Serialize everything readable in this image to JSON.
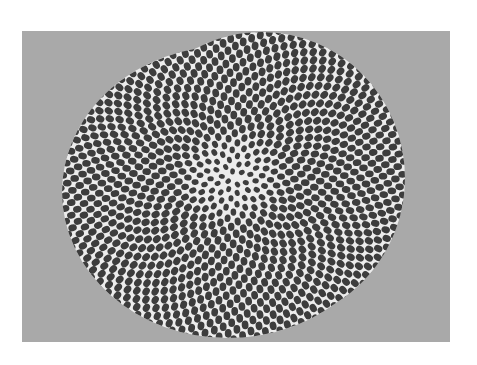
{
  "image": {
    "description": "Photograph of an artwork: hundreds of dark oval seeds arranged in interlocking spiral (phyllotaxis) patterns forming a large round disc on a gray background",
    "canvas": {
      "width": 477,
      "height": 365,
      "background": "#ffffff"
    },
    "panel": {
      "x": 22,
      "y": 31,
      "width": 428,
      "height": 311,
      "color": "#a9a9a9"
    },
    "disc": {
      "gap_color": "#ececec",
      "lobes": [
        {
          "cx": 228,
          "cy": 192,
          "rx": 166,
          "ry": 146
        },
        {
          "cx": 262,
          "cy": 178,
          "rx": 143,
          "ry": 146
        }
      ]
    },
    "seeds": {
      "color": "#3d3d3d",
      "center": {
        "x": 232,
        "y": 178
      },
      "count": 1250,
      "spacing": 5.05,
      "size": {
        "rx": 4.3,
        "ry": 3.4
      },
      "golden_angle_deg": 137.508
    }
  }
}
